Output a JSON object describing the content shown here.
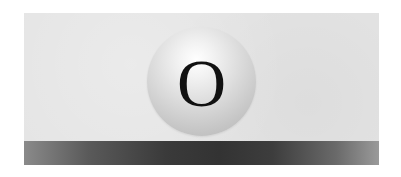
{
  "graphic": {
    "letter": "O",
    "colors": {
      "background": "#ffffff",
      "panel": "#e4e4e4",
      "bar_center": "#333333",
      "bar_edge": "#9a9a9a",
      "sphere_highlight": "#ffffff",
      "sphere_shadow": "#b4b4b4",
      "letter": "#111111"
    }
  }
}
